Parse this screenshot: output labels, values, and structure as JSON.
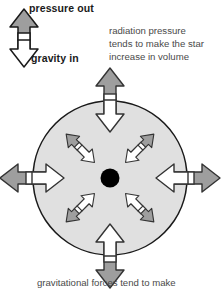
{
  "diagram": {
    "background_color": "#ffffff",
    "star": {
      "name": "star-body",
      "fill_color": "#e0e0e0",
      "stroke_color": "#1a1a1a",
      "center_dot_color": "#000000",
      "cx": 110,
      "cy": 178,
      "radius": 77
    },
    "arrow_colors": {
      "outward_head": "#9e9e9e",
      "inward_head": "#ffffff",
      "outline": "#333333",
      "shaft": "#ffffff"
    }
  },
  "legend": {
    "name": "force-legend",
    "arrow_name": "legend-double-arrow",
    "pressure_out_label": "pressure out",
    "gravity_in_label": "gravity in",
    "outward_head_color": "#9e9e9e",
    "inward_head_color": "#ffffff"
  },
  "annotations": {
    "radiation_note": {
      "name": "radiation-pressure-note",
      "lines": [
        "radiation pressure",
        "tends to make the star",
        "increase in volume"
      ]
    },
    "gravity_note": {
      "name": "gravitational-forces-note",
      "lines": [
        "gravitational forces tend to make"
      ]
    }
  },
  "force_arrows": [
    {
      "name": "force-arrow-up",
      "direction": "up",
      "angle": -90,
      "kind": "cardinal"
    },
    {
      "name": "force-arrow-down",
      "direction": "down",
      "angle": 90,
      "kind": "cardinal"
    },
    {
      "name": "force-arrow-left",
      "direction": "left",
      "angle": 180,
      "kind": "cardinal"
    },
    {
      "name": "force-arrow-right",
      "direction": "right",
      "angle": 0,
      "kind": "cardinal"
    },
    {
      "name": "force-arrow-up-left",
      "direction": "up-left",
      "angle": -135,
      "kind": "diagonal"
    },
    {
      "name": "force-arrow-up-right",
      "direction": "up-right",
      "angle": -45,
      "kind": "diagonal"
    },
    {
      "name": "force-arrow-down-left",
      "direction": "down-left",
      "angle": 135,
      "kind": "diagonal"
    },
    {
      "name": "force-arrow-down-right",
      "direction": "down-right",
      "angle": 45,
      "kind": "diagonal"
    }
  ]
}
